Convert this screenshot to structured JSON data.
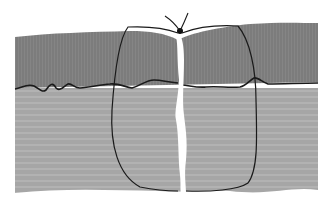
{
  "diagram": {
    "parts": [
      "epidermis-upper-layer",
      "dermis-lower-layer",
      "wound-gap",
      "suture-loop",
      "suture-knot"
    ],
    "colors": {
      "background": "#ffffff",
      "upper_layer": "#7d7d7d",
      "lower_layer": "#a9a9a9",
      "outline": "#1a1a1a",
      "wound_gap": "#ffffff"
    }
  }
}
